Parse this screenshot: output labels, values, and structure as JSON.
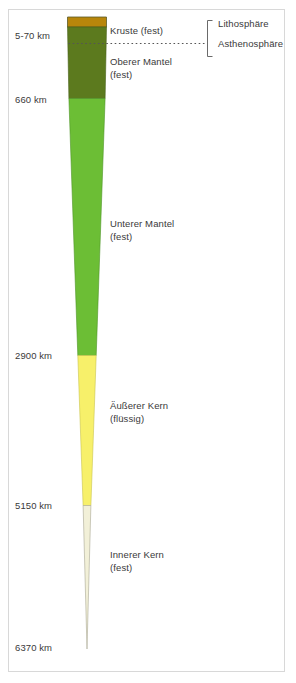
{
  "figure": {
    "language": "de",
    "background_color": "#ffffff",
    "frame_color": "#d8d8d8",
    "text_color": "#3a3a3a"
  },
  "depth_axis": {
    "unit": "km",
    "ticks": [
      {
        "label": "5-70 km",
        "depth_km": "5-70",
        "y": 36
      },
      {
        "label": "660 km",
        "depth_km": "660",
        "y": 100
      },
      {
        "label": "2900 km",
        "depth_km": "2900",
        "y": 357
      },
      {
        "label": "5150 km",
        "depth_km": "5150",
        "y": 507
      },
      {
        "label": "6370 km",
        "depth_km": "6370",
        "y": 649
      }
    ]
  },
  "layers": [
    {
      "name": "Kruste (fest)",
      "short": "Kruste",
      "state": "fest",
      "color": "#b8860b",
      "top_depth_km": 0,
      "bottom_depth_km": 70,
      "label_x": 110,
      "label_y": 30
    },
    {
      "name": "Oberer Mantel (fest)",
      "short": "Oberer Mantel",
      "state": "fest",
      "color": "#5c7a1e",
      "top_depth_km": 70,
      "bottom_depth_km": 660,
      "label_line1": "Oberer Mantel",
      "label_line2": "(fest)",
      "label_x": 110,
      "label_y": 58
    },
    {
      "name": "Unterer Mantel (fest)",
      "short": "Unterer Mantel",
      "state": "fest",
      "color": "#6cbe35",
      "top_depth_km": 660,
      "bottom_depth_km": 2900,
      "label_line1": "Unterer Mantel",
      "label_line2": "(fest)",
      "label_x": 110,
      "label_y": 222
    },
    {
      "name": "Äußerer Kern (flüssig)",
      "short": "Äußerer Kern",
      "state": "flüssig",
      "color": "#f7f06a",
      "top_depth_km": 2900,
      "bottom_depth_km": 5150,
      "label_line1": "Äußerer Kern",
      "label_line2": "(flüssig)",
      "label_x": 110,
      "label_y": 404
    },
    {
      "name": "Innerer Kern (fest)",
      "short": "Innerer Kern",
      "state": "fest",
      "color": "#f2f0d8",
      "top_depth_km": 5150,
      "bottom_depth_km": 6370,
      "label_line1": "Innerer Kern",
      "label_line2": "(fest)",
      "label_x": 110,
      "label_y": 554
    }
  ],
  "mechanical_layers": {
    "bracket_x": 208,
    "items": [
      {
        "label": "Lithosphäre",
        "label_x": 219,
        "label_y": 24
      },
      {
        "label": "Asthenosphäre",
        "label_x": 219,
        "label_y": 44
      }
    ],
    "boundary_style": "dotted",
    "boundary_y": 43
  }
}
